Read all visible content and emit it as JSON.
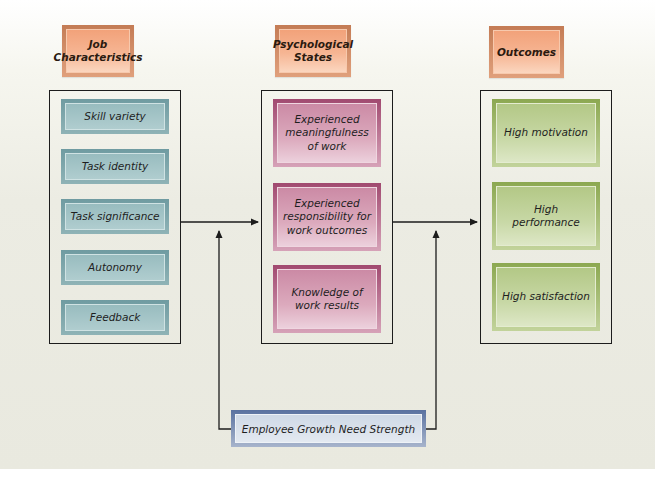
{
  "diagram": {
    "type": "job-characteristics-model",
    "columns": [
      {
        "header": "Job Characteristics",
        "color": "#8fb3b6",
        "items": [
          "Skill variety",
          "Task identity",
          "Task significance",
          "Autonomy",
          "Feedback"
        ]
      },
      {
        "header": "Psychological States",
        "color": "#dcaabd",
        "items": [
          "Experienced meaningfulness of work",
          "Experienced responsibility for work outcomes",
          "Knowledge of work results"
        ]
      },
      {
        "header": "Outcomes",
        "color": "#c8d8a6",
        "items": [
          "High motivation",
          "High performance",
          "High satisfaction"
        ]
      }
    ],
    "moderator": {
      "label": "Employee Growth Need Strength",
      "color": "#5a72a0"
    },
    "edges": [
      {
        "from": "Job Characteristics",
        "to": "Psychological States",
        "type": "arrow"
      },
      {
        "from": "Psychological States",
        "to": "Outcomes",
        "type": "arrow"
      },
      {
        "from": "Employee Growth Need Strength",
        "to": "Job Characteristics -> Psychological States",
        "type": "moderating-arrow"
      },
      {
        "from": "Employee Growth Need Strength",
        "to": "Psychological States -> Outcomes",
        "type": "moderating-arrow"
      }
    ]
  }
}
